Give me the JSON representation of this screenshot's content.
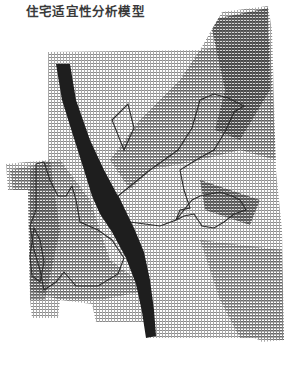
{
  "title": "住宅适宜性分析模型",
  "map": {
    "type": "raster-suitability-map",
    "colors": {
      "background": "#ffffff",
      "river": "#1e1e1e",
      "zone_outline": "#2c2c2c",
      "high": "#6e6e6e",
      "medium": "#9a9a9a",
      "low": "#c8c8c8"
    },
    "layers": [
      {
        "name": "suitability-raster",
        "description": "dithered grayscale suitability grid"
      },
      {
        "name": "river",
        "description": "dark diagonal band crossing map from top-left to bottom-center"
      },
      {
        "name": "zone-outlines",
        "description": "outlined high-suitability zones"
      }
    ]
  }
}
